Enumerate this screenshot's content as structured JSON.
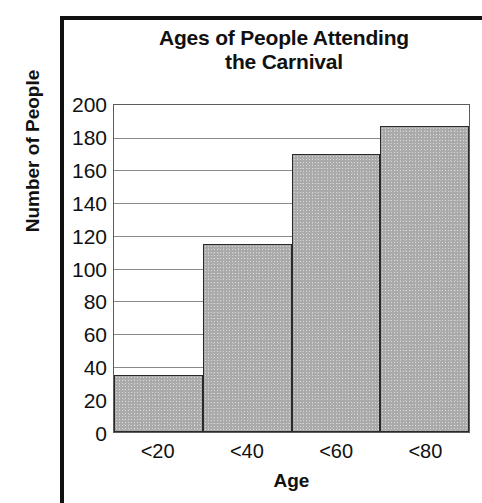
{
  "chart_data": {
    "type": "bar",
    "title_lines": [
      "Ages of People Attending",
      "the Carnival"
    ],
    "categories": [
      "<20",
      "<40",
      "<60",
      "<80"
    ],
    "values": [
      35,
      115,
      170,
      187
    ],
    "xlabel": "Age",
    "ylabel": "Number of People",
    "ylim": [
      0,
      200
    ],
    "ytick_step": 20,
    "yticks": [
      "200",
      "180",
      "160",
      "140",
      "120",
      "100",
      "80",
      "60",
      "40",
      "20",
      "0"
    ],
    "grid": true,
    "legend": false,
    "bar_color": "#aaaaaa",
    "bar_border_color": "#2a2a2a",
    "gridline_color": "#8a8a8a",
    "background_color": "#ffffff",
    "text_color": "#111111"
  }
}
